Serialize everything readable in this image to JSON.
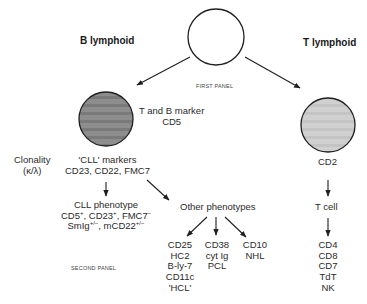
{
  "diagram": {
    "b_lineage": {
      "title": "B lymphoid"
    },
    "t_lineage": {
      "title": "T lymphoid"
    },
    "first_panel_label": "FIRST PANEL",
    "second_panel_label": "SECOND PANEL",
    "b_node": {
      "marker_line1": "T and B marker",
      "marker_line2": "CD5"
    },
    "clonality": {
      "line1": "Clonality",
      "line2": "(κ/λ)"
    },
    "cll_markers": {
      "line1": "'CLL' markers",
      "line2": "CD23, CD22, FMC7"
    },
    "cll_phenotype": {
      "line1": "CLL phenotype",
      "line2_parts": [
        "CD5",
        "+",
        ", CD23",
        "+",
        ", FMC7",
        "−"
      ],
      "line3_parts": [
        "SmIg",
        "+/−",
        ", mCD22",
        "+/−"
      ]
    },
    "other_phenotypes": {
      "title": "Other phenotypes",
      "groups": [
        {
          "lines": [
            "CD25",
            "HC2",
            "B-ly-7",
            "CD11c",
            "'HCL'"
          ]
        },
        {
          "lines": [
            "CD38",
            "cyt Ig",
            "PCL"
          ]
        },
        {
          "lines": [
            "CD10",
            "NHL"
          ]
        }
      ]
    },
    "t_node": {
      "marker": "CD2"
    },
    "t_cell": {
      "label": "T cell",
      "markers": [
        "CD4",
        "CD8",
        "CD7",
        "TdT",
        "NK"
      ]
    },
    "colors": {
      "top_circle_fill": "#ffffff",
      "b_circle_fill": "#8a8a8a",
      "t_circle_fill": "#cdcdcd",
      "stroke": "#1f1f1f"
    }
  }
}
